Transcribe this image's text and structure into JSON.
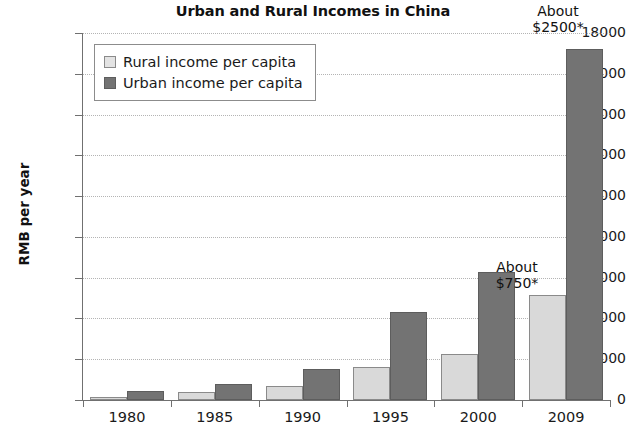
{
  "chart_data": {
    "type": "bar",
    "title": "Urban and Rural Incomes in China",
    "xlabel": "",
    "ylabel": "RMB per year",
    "ylim": [
      0,
      18000
    ],
    "ytick_step": 2000,
    "yticks": [
      18000,
      16000,
      14000,
      12000,
      10000,
      8000,
      6000,
      4000,
      2000,
      0
    ],
    "ytick_labels": [
      "18000",
      "16000",
      "14000",
      "12000",
      "10000",
      "8000",
      "6000",
      "4000",
      "2000",
      "0"
    ],
    "categories": [
      "1980",
      "1985",
      "1990",
      "1995",
      "2000",
      "2009"
    ],
    "grid": true,
    "grid_axis": "y",
    "legend_position": "upper-left-inside",
    "series": [
      {
        "name": "Rural income per capita",
        "color": "#d9d9d9",
        "values": [
          150,
          400,
          700,
          1600,
          2250,
          5150
        ]
      },
      {
        "name": "Urban income per capita",
        "color": "#737373",
        "values": [
          450,
          800,
          1500,
          4300,
          6300,
          17200
        ]
      }
    ],
    "annotations": [
      {
        "id": "annotation-urban-2009",
        "line1": "About",
        "line2": "$2500*",
        "target_series": "Urban income per capita",
        "target_category": "2009"
      },
      {
        "id": "annotation-rural-2009",
        "line1": "About",
        "line2": "$750*",
        "target_series": "Rural income per capita",
        "target_category": "2009"
      }
    ]
  },
  "legend": {
    "items": [
      {
        "label": "Rural income per capita",
        "swatch": "rural"
      },
      {
        "label": "Urban income per capita",
        "swatch": "urban"
      }
    ]
  },
  "colors": {
    "rural_fill": "#d9d9d9",
    "urban_fill": "#737373",
    "axis": "#707070",
    "gridline": "#b4b4b4",
    "text": "#1a1a1a",
    "background": "#ffffff"
  }
}
